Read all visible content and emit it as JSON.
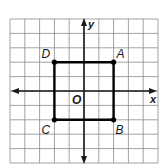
{
  "diagram": {
    "type": "coordinate-grid",
    "grid": {
      "x_min": -5,
      "x_max": 5,
      "y_min": -5,
      "y_max": 5,
      "grid_color": "#8a8a8a",
      "axis_color": "#1a1a1a"
    },
    "axes": {
      "x_label": "x",
      "y_label": "y",
      "origin_label": "O"
    },
    "shape": {
      "kind": "square",
      "stroke_color": "#000000",
      "vertices": [
        {
          "name": "A",
          "x": 2,
          "y": 2
        },
        {
          "name": "B",
          "x": 2,
          "y": -2
        },
        {
          "name": "C",
          "x": -2,
          "y": -2
        },
        {
          "name": "D",
          "x": -2,
          "y": 2
        }
      ]
    },
    "labels": {
      "A": "A",
      "B": "B",
      "C": "C",
      "D": "D"
    }
  }
}
